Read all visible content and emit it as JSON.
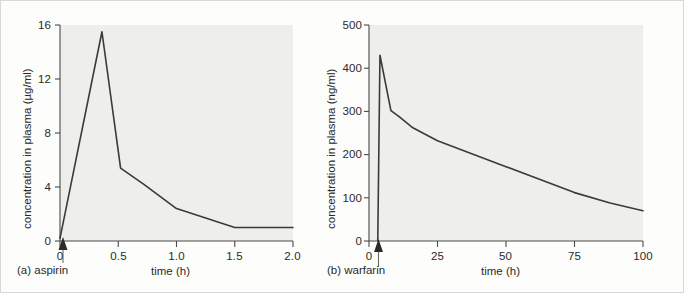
{
  "figure": {
    "background_color": "#fdfdfc",
    "plot_background_color": "#eeeeec",
    "line_color": "#3a3a3a",
    "axis_color": "#4a4a4a"
  },
  "chart_data": [
    {
      "type": "line",
      "panel_label": "(a) aspirin",
      "drug": "aspirin",
      "title": "",
      "xlabel": "time (h)",
      "ylabel": "concentration in plasma (µg/ml)",
      "xlim": [
        0,
        2.0
      ],
      "ylim": [
        0,
        16
      ],
      "xticks": [
        0,
        0.5,
        1.0,
        1.5,
        2.0
      ],
      "xtick_labels": [
        "0",
        "0.5",
        "1.0",
        "1.5",
        "2.0"
      ],
      "yticks": [
        0,
        4,
        8,
        12,
        16
      ],
      "ytick_labels": [
        "0",
        "4",
        "8",
        "12",
        "16"
      ],
      "grid": false,
      "legend": "none",
      "dose_marker": {
        "label": "dose administered",
        "x": 0.03,
        "symbol": "up-arrow"
      },
      "x": [
        0.0,
        0.36,
        0.52,
        0.72,
        1.0,
        1.5,
        2.0
      ],
      "y": [
        0.2,
        15.5,
        5.4,
        4.2,
        2.4,
        1.0,
        1.0
      ],
      "peak": {
        "x": 0.36,
        "y": 15.5
      }
    },
    {
      "type": "line",
      "panel_label": "(b) warfarin",
      "drug": "warfarin",
      "title": "",
      "xlabel": "time (h)",
      "ylabel": "concentration in plasma (ng/ml)",
      "xlim": [
        0,
        100
      ],
      "ylim": [
        0,
        500
      ],
      "xticks": [
        0,
        25,
        50,
        75,
        100
      ],
      "xtick_labels": [
        "0",
        "25",
        "50",
        "75",
        "100"
      ],
      "yticks": [
        0,
        100,
        200,
        300,
        400,
        500
      ],
      "ytick_labels": [
        "0",
        "100",
        "200",
        "300",
        "400",
        "500"
      ],
      "grid": false,
      "legend": "none",
      "dose_marker": {
        "label": "dose administered",
        "x": 3.5,
        "symbol": "up-arrow"
      },
      "x": [
        3.2,
        4.0,
        8.0,
        11.0,
        16.0,
        25.0,
        50.0,
        75.0,
        88.0,
        100.0
      ],
      "y": [
        0.0,
        430.0,
        302.0,
        288.0,
        262.0,
        232.0,
        172.0,
        112.0,
        88.0,
        70.0
      ],
      "peak": {
        "x": 4.0,
        "y": 430
      }
    }
  ]
}
